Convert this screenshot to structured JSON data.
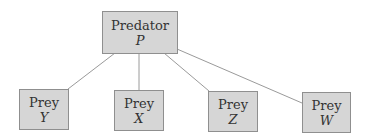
{
  "diagram": {
    "type": "tree",
    "root": {
      "id": "P",
      "label": "Predator",
      "variable": "P"
    },
    "children": [
      {
        "id": "Y",
        "label": "Prey",
        "variable": "Y"
      },
      {
        "id": "X",
        "label": "Prey",
        "variable": "X"
      },
      {
        "id": "Z",
        "label": "Prey",
        "variable": "Z"
      },
      {
        "id": "W",
        "label": "Prey",
        "variable": "W"
      }
    ],
    "edges": [
      [
        "P",
        "Y"
      ],
      [
        "P",
        "X"
      ],
      [
        "P",
        "Z"
      ],
      [
        "P",
        "W"
      ]
    ],
    "colors": {
      "node_fill": "#d6d6d6",
      "node_border": "#8f8f8f",
      "edge": "#999999"
    }
  }
}
